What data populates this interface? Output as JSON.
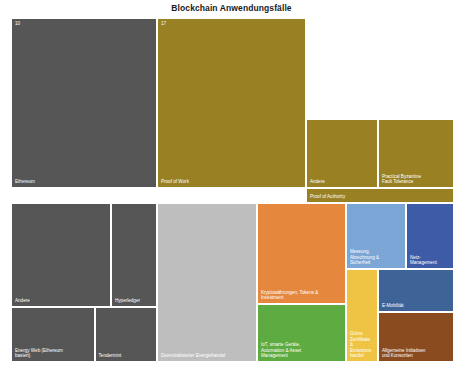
{
  "chart_data": {
    "type": "treemap",
    "title": "Blockchain Anwendungsfälle",
    "xlabel": "",
    "ylabel": "",
    "grid": false,
    "legend": "none",
    "corner_values": [
      {
        "text": "10"
      },
      {
        "text": "17"
      }
    ],
    "nodes": [
      {
        "label": "Ethereum",
        "color": "#555555",
        "x": 0.0,
        "y": 0.0,
        "w": 0.3295,
        "h": 0.4942,
        "text_color": "light",
        "corner_value": "10"
      },
      {
        "label": "Proof of Work",
        "color": "#9a8122",
        "x": 0.3295,
        "y": 0.0,
        "w": 0.3363,
        "h": 0.4942,
        "text_color": "light",
        "corner_value": "17"
      },
      {
        "label": "Andere",
        "color": "#9a8122",
        "x": 0.6658,
        "y": 0.2936,
        "w": 0.1625,
        "h": 0.2006,
        "text_color": "light",
        "corner_value": ""
      },
      {
        "label": "Practical Byzantine\nFault Tolerance",
        "color": "#9a8122",
        "x": 0.8283,
        "y": 0.2936,
        "w": 0.1717,
        "h": 0.2006,
        "text_color": "light",
        "corner_value": ""
      },
      {
        "label": "Proof of Authority",
        "color": "#9a8122",
        "x": 0.6658,
        "y": 0.4942,
        "w": 0.3342,
        "h": 0.0436,
        "text_color": "light",
        "corner_value": ""
      },
      {
        "label": "Andere",
        "color": "#555555",
        "x": 0.0,
        "y": 0.5378,
        "w": 0.2257,
        "h": 0.3023,
        "text_color": "light",
        "corner_value": ""
      },
      {
        "label": "Hyperledger",
        "color": "#555555",
        "x": 0.2257,
        "y": 0.5378,
        "w": 0.1038,
        "h": 0.3023,
        "text_color": "light",
        "corner_value": ""
      },
      {
        "label": "Energy Web (Ethereum\nbasiert)",
        "color": "#555555",
        "x": 0.0,
        "y": 0.8401,
        "w": 0.1886,
        "h": 0.1599,
        "text_color": "light",
        "corner_value": ""
      },
      {
        "label": "Tendermint",
        "color": "#555555",
        "x": 0.1886,
        "y": 0.8401,
        "w": 0.1409,
        "h": 0.1599,
        "text_color": "light",
        "corner_value": ""
      },
      {
        "label": "Dezentralisierter Energiehandel",
        "color": "#c0c0c0",
        "x": 0.3295,
        "y": 0.5378,
        "w": 0.2257,
        "h": 0.4622,
        "text_color": "light",
        "corner_value": ""
      },
      {
        "label": "Kryptowährungen, Tokens &\nInvestment",
        "color": "#e8893c",
        "x": 0.5552,
        "y": 0.5378,
        "w": 0.2009,
        "h": 0.2936,
        "text_color": "light",
        "corner_value": ""
      },
      {
        "label": "IoT, smarte Geräte,\nAutomation & Asset\nManagement",
        "color": "#5cad3f",
        "x": 0.5552,
        "y": 0.8314,
        "w": 0.2009,
        "h": 0.1686,
        "text_color": "light",
        "corner_value": ""
      },
      {
        "label": "Messung,\nAbrechnung &\nSicherheit",
        "color": "#7ba7d7",
        "x": 0.7561,
        "y": 0.5378,
        "w": 0.1354,
        "h": 0.1919,
        "text_color": "light",
        "corner_value": ""
      },
      {
        "label": "Netz-\nManagement",
        "color": "#3c5ba8",
        "x": 0.8915,
        "y": 0.5378,
        "w": 0.1085,
        "h": 0.1919,
        "text_color": "light",
        "corner_value": ""
      },
      {
        "label": "Grüne\nZertifikate\n&\nEmissions-\nhandel",
        "color": "#f2c643",
        "x": 0.7561,
        "y": 0.7297,
        "w": 0.0722,
        "h": 0.2703,
        "text_color": "light",
        "corner_value": ""
      },
      {
        "label": "E-Mobilität",
        "color": "#3c6398",
        "x": 0.8283,
        "y": 0.7297,
        "w": 0.1717,
        "h": 0.125,
        "text_color": "light",
        "corner_value": ""
      },
      {
        "label": "Allgemeine Initiativen\nund Konsortien",
        "color": "#8a4a1e",
        "x": 0.8283,
        "y": 0.8547,
        "w": 0.1717,
        "h": 0.1453,
        "text_color": "light",
        "corner_value": ""
      }
    ]
  }
}
